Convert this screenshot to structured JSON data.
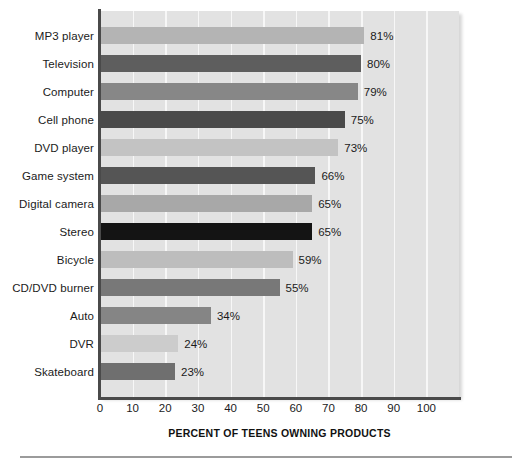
{
  "chart_data": {
    "type": "bar",
    "orientation": "horizontal",
    "title": "",
    "xlabel": "PERCENT OF TEENS OWNING PRODUCTS",
    "ylabel": "",
    "xlim": [
      0,
      110
    ],
    "xticks": [
      0,
      10,
      20,
      30,
      40,
      50,
      60,
      70,
      80,
      90,
      100
    ],
    "xtick_labels": [
      "0",
      "10",
      "20",
      "30",
      "40",
      "50",
      "60",
      "70",
      "80",
      "90",
      "100"
    ],
    "grid": "vertical",
    "legend": "none",
    "categories": [
      "MP3 player",
      "Television",
      "Computer",
      "Cell phone",
      "DVD player",
      "Game system",
      "Digital camera",
      "Stereo",
      "Bicycle",
      "CD/DVD burner",
      "Auto",
      "DVR",
      "Skateboard"
    ],
    "values": [
      81,
      80,
      79,
      75,
      73,
      66,
      65,
      65,
      59,
      55,
      34,
      24,
      23
    ],
    "value_labels": [
      "81%",
      "80%",
      "79%",
      "75%",
      "73%",
      "66%",
      "65%",
      "65%",
      "59%",
      "55%",
      "34%",
      "24%",
      "23%"
    ],
    "bar_colors": [
      "#b4b4b4",
      "#5e5e5e",
      "#878787",
      "#4a4a4a",
      "#c3c3c3",
      "#555555",
      "#a8a8a8",
      "#141414",
      "#bdbdbd",
      "#787878",
      "#858585",
      "#cccccc",
      "#6f6f6f"
    ],
    "plot_background": "#e2e2e2",
    "gridline_color": "#f7f7f7",
    "axis_color": "#4a4a4a"
  }
}
